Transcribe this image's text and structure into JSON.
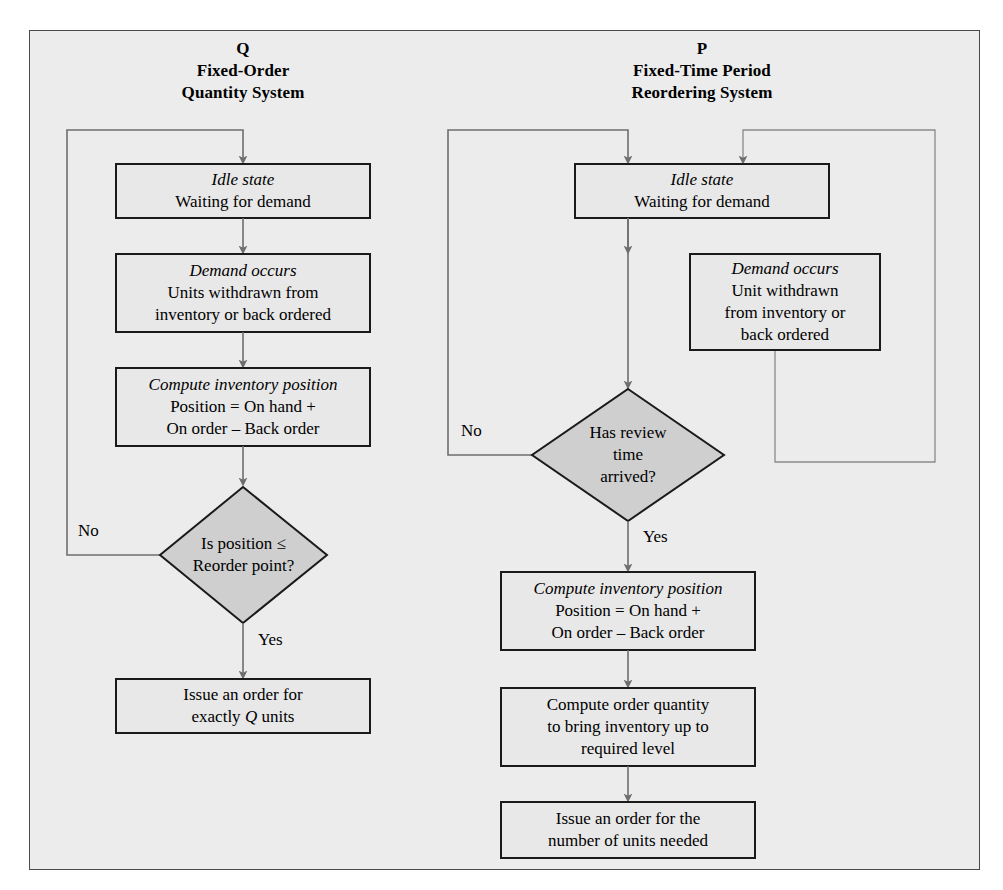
{
  "figure": {
    "type": "flowchart",
    "background_color": "#ececec",
    "frame_border_color": "#4a4a4a",
    "box_fill": "#e8e8e8",
    "diamond_fill": "#cfcfcf",
    "connector_color": "#6e6e6e"
  },
  "columns": [
    {
      "id": "q-system",
      "symbol": "Q",
      "title_line1": "Fixed-Order",
      "title_line2": "Quantity System"
    },
    {
      "id": "p-system",
      "symbol": "P",
      "title_line1": "Fixed-Time Period",
      "title_line2": "Reordering System"
    }
  ],
  "left_nodes": [
    {
      "id": "q-idle",
      "shape": "box",
      "emphasis": "Idle state",
      "lines": [
        "Waiting for demand"
      ]
    },
    {
      "id": "q-demand",
      "shape": "box",
      "emphasis": "Demand occurs",
      "lines": [
        "Units withdrawn from",
        "inventory or back ordered"
      ]
    },
    {
      "id": "q-compute",
      "shape": "box",
      "emphasis": "Compute inventory position",
      "lines": [
        "Position = On hand +",
        "On order – Back order"
      ]
    },
    {
      "id": "q-decision",
      "shape": "diamond",
      "emphasis": "",
      "lines": [
        "Is position ≤",
        "Reorder point?"
      ]
    },
    {
      "id": "q-issue",
      "shape": "box",
      "emphasis": "",
      "lines": [
        "Issue an order for",
        "exactly <i>Q</i> units"
      ]
    }
  ],
  "right_nodes": [
    {
      "id": "p-idle",
      "shape": "box",
      "emphasis": "Idle state",
      "lines": [
        "Waiting for demand"
      ]
    },
    {
      "id": "p-demand",
      "shape": "box",
      "emphasis": "Demand occurs",
      "lines": [
        "Unit withdrawn",
        "from inventory or",
        "back ordered"
      ]
    },
    {
      "id": "p-decision",
      "shape": "diamond",
      "emphasis": "",
      "lines": [
        "Has review",
        "time",
        "arrived?"
      ]
    },
    {
      "id": "p-compute",
      "shape": "box",
      "emphasis": "Compute inventory position",
      "lines": [
        "Position = On hand +",
        "On order – Back order"
      ]
    },
    {
      "id": "p-quantity",
      "shape": "box",
      "emphasis": "",
      "lines": [
        "Compute order quantity",
        "to bring inventory up to",
        "required level"
      ]
    },
    {
      "id": "p-issue",
      "shape": "box",
      "emphasis": "",
      "lines": [
        "Issue an order for the",
        "number of units needed"
      ]
    }
  ],
  "edge_labels": {
    "left_no": "No",
    "left_yes": "Yes",
    "right_no": "No",
    "right_yes": "Yes"
  }
}
